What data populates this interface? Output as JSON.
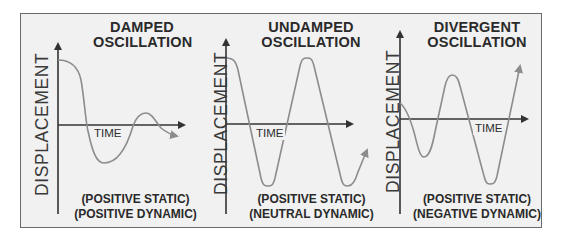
{
  "diagram": {
    "panels": [
      {
        "id": "damped",
        "title_line1": "DAMPED",
        "title_line2": "OSCILLATION",
        "y_axis_label": "DISPLACEMENT",
        "x_axis_label": "TIME",
        "stability_static": "(POSITIVE STATIC)",
        "stability_dynamic": "(POSITIVE DYNAMIC)",
        "curve_behavior": "decaying oscillation"
      },
      {
        "id": "undamped",
        "title_line1": "UNDAMPED",
        "title_line2": "OSCILLATION",
        "y_axis_label": "DISPLACEMENT",
        "x_axis_label": "TIME",
        "stability_static": "(POSITIVE STATIC)",
        "stability_dynamic": "(NEUTRAL DYNAMIC)",
        "curve_behavior": "constant-amplitude oscillation"
      },
      {
        "id": "divergent",
        "title_line1": "DIVERGENT",
        "title_line2": "OSCILLATION",
        "y_axis_label": "DISPLACEMENT",
        "x_axis_label": "TIME",
        "stability_static": "(POSITIVE STATIC)",
        "stability_dynamic": "(NEGATIVE DYNAMIC)",
        "curve_behavior": "growing oscillation"
      }
    ],
    "colors": {
      "background": "#f1f1f1",
      "border": "#6a6a6a",
      "axis": "#333333",
      "curve": "#8c8c8c",
      "text": "#2a2a2a"
    }
  }
}
